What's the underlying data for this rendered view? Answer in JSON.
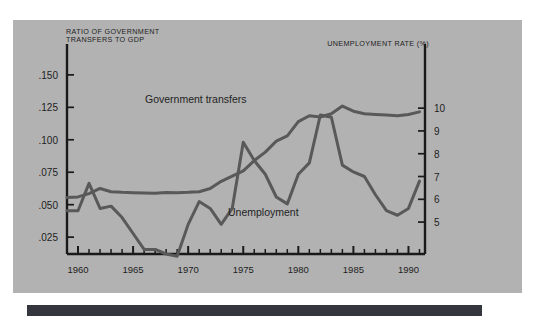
{
  "panel": {
    "background_color": "#b2b2b2",
    "page_background_color": "#ffffff",
    "footer_bar_color": "#33363c"
  },
  "left_axis_title_line1": "RATIO OF GOVERNMENT",
  "left_axis_title_line2": "TRANSFERS TO GDP",
  "right_axis_title": "UNEMPLOYMENT RATE (%)",
  "series_labels": {
    "transfers": "Government transfers",
    "unemployment": "Unemployment"
  },
  "chart_data": {
    "type": "line",
    "title": "",
    "subtitle": "",
    "xlabel": "",
    "ylabel": "RATIO OF GOVERNMENT TRANSFERS TO GDP",
    "y2label": "UNEMPLOYMENT RATE (%)",
    "grid": false,
    "legend": "inline-annotations",
    "line_color": "#595959",
    "axis_color": "#1a1a1a",
    "xlim": [
      1959,
      1991.5
    ],
    "xticks": [
      1960,
      1965,
      1970,
      1975,
      1980,
      1985,
      1990
    ],
    "xticklabels": [
      "1960",
      "1965",
      "1970",
      "1975",
      "1980",
      "1985",
      "1990"
    ],
    "xminor_step": 1,
    "ylim": [
      0.012,
      0.163
    ],
    "yticks": [
      0.025,
      0.05,
      0.075,
      0.1,
      0.125,
      0.15
    ],
    "yticklabels": [
      ".025",
      ".050",
      ".075",
      ".100",
      ".125",
      ".150"
    ],
    "y2lim": [
      3.6,
      12.2
    ],
    "y2ticks": [
      5,
      6,
      7,
      8,
      9,
      10
    ],
    "y2ticklabels": [
      "5",
      "6",
      "7",
      "8",
      "9",
      "10"
    ],
    "x": [
      1959,
      1960,
      1961,
      1962,
      1963,
      1964,
      1965,
      1966,
      1967,
      1968,
      1969,
      1970,
      1971,
      1972,
      1973,
      1974,
      1975,
      1976,
      1977,
      1978,
      1979,
      1980,
      1981,
      1982,
      1983,
      1984,
      1985,
      1986,
      1987,
      1988,
      1989,
      1990,
      1991
    ],
    "series": [
      {
        "name": "Government transfers",
        "axis": "left",
        "unit": "ratio of GDP",
        "values": [
          0.0555,
          0.056,
          0.0585,
          0.0625,
          0.06,
          0.0595,
          0.0592,
          0.059,
          0.0588,
          0.0593,
          0.0592,
          0.0595,
          0.06,
          0.0625,
          0.068,
          0.072,
          0.076,
          0.084,
          0.0905,
          0.099,
          0.103,
          0.114,
          0.1185,
          0.1175,
          0.12,
          0.126,
          0.122,
          0.12,
          0.1195,
          0.119,
          0.1185,
          0.1195,
          0.1215
        ]
      },
      {
        "name": "Unemployment",
        "axis": "right",
        "unit": "percent",
        "values": [
          5.5,
          5.5,
          6.7,
          5.6,
          5.7,
          5.2,
          4.5,
          3.8,
          3.8,
          3.6,
          3.5,
          4.9,
          5.9,
          5.6,
          4.9,
          5.6,
          8.5,
          7.7,
          7.1,
          6.1,
          5.8,
          7.1,
          7.6,
          9.7,
          9.6,
          7.5,
          7.2,
          7.0,
          6.2,
          5.5,
          5.3,
          5.6,
          6.8
        ]
      }
    ]
  }
}
